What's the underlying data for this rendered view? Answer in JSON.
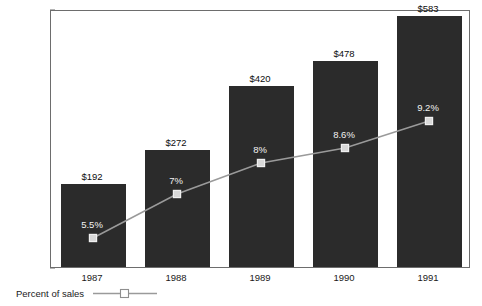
{
  "chart_data": {
    "type": "bar",
    "title": "",
    "xlabel": "",
    "ylabel": "Dollars (millions)",
    "categories": [
      "1987",
      "1988",
      "1989",
      "1990",
      "1991"
    ],
    "ylim": [
      0,
      600
    ],
    "yticks": [
      0,
      100,
      200,
      300,
      400,
      500,
      600
    ],
    "ytick_labels": [
      "$0",
      "$100",
      "$200",
      "$300",
      "$400",
      "$500",
      "$600"
    ],
    "grid": false,
    "legend_position": "below-axis-left",
    "series": [
      {
        "name": "Dollars (millions)",
        "kind": "bar",
        "color": "#2b2b2b",
        "values": [
          192,
          272,
          420,
          478,
          583
        ],
        "value_labels": [
          "$192",
          "$272",
          "$420",
          "$478",
          "$583"
        ]
      },
      {
        "name": "Percent of sales",
        "kind": "line",
        "color": "#9a9a9a",
        "marker": "open-square",
        "values": [
          5.5,
          7,
          8,
          8.6,
          9.2
        ],
        "value_labels": [
          "5.5%",
          "7%",
          "8%",
          "8.6%",
          "9.2%"
        ],
        "secondary_axis": true
      }
    ]
  },
  "legend": {
    "label": "Percent of sales",
    "marker_icon": "open-square-marker-icon"
  },
  "colors": {
    "bar_fill": "#2b2b2b",
    "line": "#9a9a9a",
    "frame": "#6d6d6d",
    "text": "#1a1a1a",
    "label_on_bar": "#f2f2f2",
    "background": "#ffffff"
  }
}
